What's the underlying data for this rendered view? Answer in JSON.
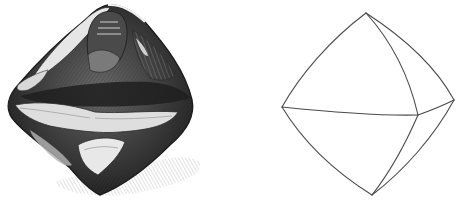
{
  "figure": {
    "caption": "Rough diamond crystal (engraving) beside a line drawing of its octahedral form",
    "colors": {
      "background": "#ffffff",
      "ink_dark": "#1e1e1e",
      "ink_mid": "#5a5a5a",
      "ink_light": "#bdbdbd",
      "line": "#4a4a4a"
    },
    "left_panel": {
      "subject": "engraved rough diamond crystal with shading and cast shadow",
      "outline": {
        "top": [
          108,
          5
        ],
        "left": [
          8,
          105
        ],
        "right": [
          192,
          105
        ],
        "bottom": [
          100,
          195
        ]
      }
    },
    "right_panel": {
      "subject": "octahedron line diagram with curved edges",
      "vertices": {
        "top": [
          366,
          13
        ],
        "left": [
          282,
          107
        ],
        "front_right": [
          418,
          115
        ],
        "far_right": [
          454,
          100
        ],
        "bottom": [
          372,
          195
        ]
      }
    }
  }
}
